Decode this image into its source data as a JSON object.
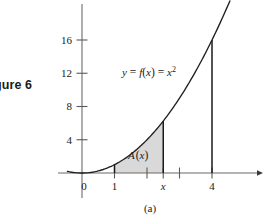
{
  "figure": {
    "label": "gure 6",
    "caption": "(a)"
  },
  "chart_data": {
    "type": "line",
    "title": "",
    "subtitle": "",
    "function_label": "y = f(x) = x",
    "function_exponent": "2",
    "function_expression": "y = f(x) = x^2",
    "area_label": "A(x)",
    "area_label_letter": "A",
    "area_label_arg": "(x)",
    "xlabel": "",
    "ylabel": "",
    "xlim": [
      -0.55,
      5.2
    ],
    "ylim": [
      -2.6,
      21.5
    ],
    "grid": false,
    "legend": null,
    "x_ticks": [
      {
        "value": 0,
        "label": "0",
        "italic": false,
        "shown": true
      },
      {
        "value": 1,
        "label": "1",
        "italic": false,
        "shown": true
      },
      {
        "value": 2,
        "label": "",
        "italic": false,
        "shown": false
      },
      {
        "value": 2.5,
        "label": "x",
        "italic": true,
        "shown": true
      },
      {
        "value": 3,
        "label": "",
        "italic": false,
        "shown": false
      },
      {
        "value": 4,
        "label": "4",
        "italic": false,
        "shown": true
      }
    ],
    "y_ticks": [
      {
        "value": 4,
        "label": "4"
      },
      {
        "value": 8,
        "label": "8"
      },
      {
        "value": 12,
        "label": "12"
      },
      {
        "value": 16,
        "label": "16"
      }
    ],
    "curve": {
      "expression": "x^2",
      "x_start": -0.45,
      "x_end": 4.55,
      "points_x": [
        -0.45,
        0,
        0.5,
        1,
        1.5,
        2,
        2.5,
        3,
        3.5,
        4,
        4.55
      ],
      "points_y": [
        0.2,
        0,
        0.25,
        1,
        2.25,
        4,
        6.25,
        9,
        12.25,
        16,
        20.7
      ]
    },
    "shaded_region": {
      "label": "A(x)",
      "x_from": 1,
      "x_to": 2.5,
      "fill_color": "#d9d9d9",
      "description": "Area under y = x^2 between x = 1 and x = x"
    },
    "vertical_lines": [
      {
        "at_x": 1,
        "to_y": 1,
        "label": "1"
      },
      {
        "at_x": 2.5,
        "to_y": 6.25,
        "label": "x"
      },
      {
        "at_x": 4,
        "to_y": 16,
        "label": "4"
      }
    ],
    "colors": {
      "curve": "#1a1a1a",
      "axis": "#5a5a5a",
      "shade": "#d9d9d9",
      "text": "#1a1a1a"
    }
  }
}
